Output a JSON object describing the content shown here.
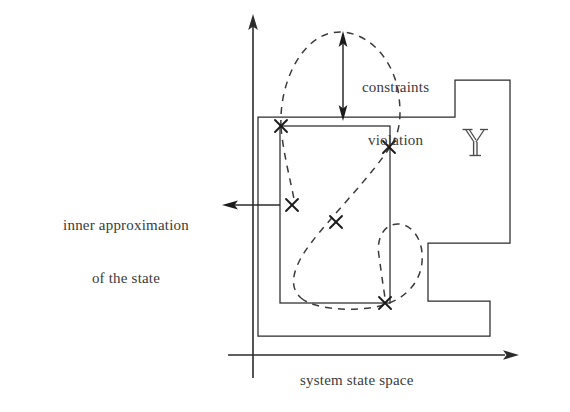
{
  "figure": {
    "background_color": "#ffffff",
    "stroke_color": "#2b2b2b",
    "text_color": "#3a3a3a"
  },
  "labels": {
    "constraints_violation_line1": "constraints",
    "constraints_violation_line2": "violation",
    "inner_approximation_line1": "inner approximation",
    "inner_approximation_line2": "of the state",
    "system_state_space": "system state space",
    "admissible_set_symbol": "        "
  },
  "axes": {
    "origin": [
      253,
      355
    ],
    "y_axis_top": [
      253,
      18
    ],
    "x_axis_right": [
      517,
      355
    ],
    "x_label": "system state space"
  },
  "shapes": {
    "outer_region_name": "admissible-constraint-set",
    "outer_region_points": "258,117 455,117 455,80 510,80 510,243 428,243 428,301 490,301 490,336 258,336",
    "inner_rectangle": {
      "x": 280,
      "y": 126,
      "width": 110,
      "height": 177
    },
    "dashed_curve_name": "reachable-state-set",
    "markers_name": "sample-state-points"
  },
  "markers": [
    {
      "id": "m1",
      "x": 281,
      "y": 126
    },
    {
      "id": "m2",
      "x": 389,
      "y": 147
    },
    {
      "id": "m3",
      "x": 292,
      "y": 205
    },
    {
      "id": "m4",
      "x": 336,
      "y": 222
    },
    {
      "id": "m5",
      "x": 385,
      "y": 303
    }
  ],
  "annotations": {
    "violation_arrow": {
      "x": 343,
      "y_top": 36,
      "y_bottom": 117,
      "double_headed": true
    },
    "inner_arrow": {
      "x_from": 280,
      "x_to": 224,
      "y": 205,
      "head": "left"
    }
  }
}
